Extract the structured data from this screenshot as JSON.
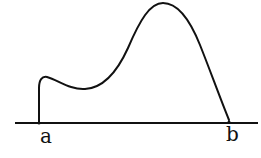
{
  "diagram": {
    "type": "function-curve-over-interval",
    "axis": {
      "x_start": 15,
      "x_end": 258,
      "y": 123,
      "color": "#111111"
    },
    "curve": {
      "color": "#111111",
      "description": "Curve rising vertically at a, small local max, dipping to local min, rising to global max, then falling to axis at b"
    },
    "points": [
      {
        "label": "a",
        "x": 39
      },
      {
        "label": "b",
        "x": 229
      }
    ]
  }
}
